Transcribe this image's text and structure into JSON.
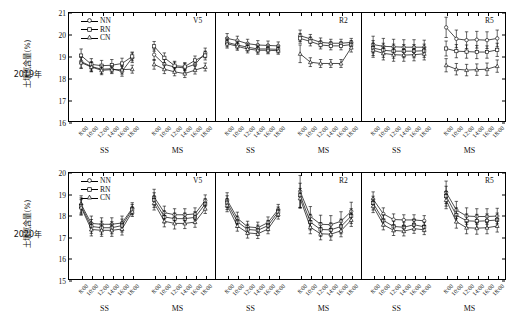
{
  "figure": {
    "y_axis_title": "土壤氮含量(%)",
    "group_labels": [
      "SS",
      "MS"
    ],
    "time_ticks": [
      "8:00",
      "10:00",
      "12:00",
      "14:00",
      "16:00",
      "18:00"
    ],
    "series_names": [
      "NN",
      "RN",
      "CN"
    ],
    "series_markers": [
      "open-circle",
      "open-square",
      "open-triangle"
    ],
    "line_color": "#000000",
    "marker_fill": "#ffffff",
    "background": "#ffffff"
  },
  "rows": [
    {
      "year_label": "2019年",
      "ylim": [
        16,
        21
      ],
      "yticks": [
        "16",
        "17",
        "18",
        "19",
        "20",
        "21"
      ],
      "has_legend": true,
      "panels": [
        {
          "stage": "V5",
          "groups": [
            {
              "name": "SS",
              "series": [
                {
                  "name": "NN",
                  "values": [
                    18.75,
                    18.52,
                    18.4,
                    18.42,
                    18.3,
                    18.92
                  ],
                  "err": [
                    0.3,
                    0.22,
                    0.2,
                    0.18,
                    0.22,
                    0.22
                  ]
                },
                {
                  "name": "RN",
                  "values": [
                    19.02,
                    18.62,
                    18.56,
                    18.58,
                    18.66,
                    18.98
                  ],
                  "err": [
                    0.3,
                    0.26,
                    0.24,
                    0.26,
                    0.24,
                    0.2
                  ]
                },
                {
                  "name": "CN",
                  "values": [
                    18.7,
                    18.5,
                    18.35,
                    18.38,
                    18.38,
                    18.4
                  ],
                  "err": [
                    0.26,
                    0.22,
                    0.2,
                    0.18,
                    0.2,
                    0.18
                  ]
                }
              ]
            },
            {
              "name": "MS",
              "series": [
                {
                  "name": "NN",
                  "values": [
                    19.06,
                    18.62,
                    18.5,
                    18.46,
                    18.62,
                    19.14
                  ],
                  "err": [
                    0.26,
                    0.22,
                    0.22,
                    0.2,
                    0.22,
                    0.22
                  ]
                },
                {
                  "name": "RN",
                  "values": [
                    19.44,
                    18.92,
                    18.56,
                    18.52,
                    18.8,
                    19.02
                  ],
                  "err": [
                    0.22,
                    0.22,
                    0.2,
                    0.18,
                    0.2,
                    0.2
                  ]
                },
                {
                  "name": "CN",
                  "values": [
                    18.62,
                    18.4,
                    18.28,
                    18.2,
                    18.36,
                    18.5
                  ],
                  "err": [
                    0.22,
                    0.2,
                    0.18,
                    0.18,
                    0.18,
                    0.18
                  ]
                }
              ]
            }
          ]
        },
        {
          "stage": "R2",
          "groups": [
            {
              "name": "SS",
              "series": [
                {
                  "name": "NN",
                  "values": [
                    19.8,
                    19.7,
                    19.56,
                    19.5,
                    19.48,
                    19.46
                  ],
                  "err": [
                    0.22,
                    0.2,
                    0.2,
                    0.2,
                    0.2,
                    0.18
                  ]
                },
                {
                  "name": "RN",
                  "values": [
                    19.62,
                    19.5,
                    19.4,
                    19.32,
                    19.32,
                    19.3
                  ],
                  "err": [
                    0.2,
                    0.18,
                    0.18,
                    0.18,
                    0.18,
                    0.16
                  ]
                },
                {
                  "name": "CN",
                  "values": [
                    19.56,
                    19.44,
                    19.32,
                    19.26,
                    19.26,
                    19.24
                  ],
                  "err": [
                    0.2,
                    0.18,
                    0.18,
                    0.18,
                    0.16,
                    0.16
                  ]
                }
              ]
            },
            {
              "name": "MS",
              "series": [
                {
                  "name": "NN",
                  "values": [
                    19.92,
                    19.78,
                    19.62,
                    19.58,
                    19.58,
                    19.62
                  ],
                  "err": [
                    0.26,
                    0.2,
                    0.2,
                    0.18,
                    0.18,
                    0.18
                  ]
                },
                {
                  "name": "RN",
                  "values": [
                    19.8,
                    19.66,
                    19.5,
                    19.46,
                    19.46,
                    19.52
                  ],
                  "err": [
                    0.22,
                    0.2,
                    0.18,
                    0.18,
                    0.18,
                    0.18
                  ]
                },
                {
                  "name": "CN",
                  "values": [
                    19.1,
                    18.72,
                    18.66,
                    18.66,
                    18.66,
                    19.38
                  ],
                  "err": [
                    0.4,
                    0.2,
                    0.18,
                    0.18,
                    0.18,
                    0.2
                  ]
                }
              ]
            }
          ]
        },
        {
          "stage": "R5",
          "groups": [
            {
              "name": "SS",
              "series": [
                {
                  "name": "NN",
                  "values": [
                    19.52,
                    19.44,
                    19.42,
                    19.4,
                    19.4,
                    19.4
                  ],
                  "err": [
                    0.38,
                    0.36,
                    0.34,
                    0.34,
                    0.34,
                    0.32
                  ]
                },
                {
                  "name": "RN",
                  "values": [
                    19.36,
                    19.26,
                    19.22,
                    19.22,
                    19.22,
                    19.24
                  ],
                  "err": [
                    0.34,
                    0.32,
                    0.32,
                    0.3,
                    0.3,
                    0.3
                  ]
                },
                {
                  "name": "CN",
                  "values": [
                    19.26,
                    19.12,
                    19.06,
                    19.04,
                    19.06,
                    19.1
                  ],
                  "err": [
                    0.32,
                    0.3,
                    0.3,
                    0.28,
                    0.28,
                    0.28
                  ]
                }
              ]
            },
            {
              "name": "MS",
              "series": [
                {
                  "name": "NN",
                  "values": [
                    20.3,
                    19.78,
                    19.72,
                    19.74,
                    19.72,
                    19.8
                  ],
                  "err": [
                    0.46,
                    0.4,
                    0.38,
                    0.38,
                    0.38,
                    0.38
                  ]
                },
                {
                  "name": "RN",
                  "values": [
                    19.34,
                    19.22,
                    19.2,
                    19.18,
                    19.18,
                    19.28
                  ],
                  "err": [
                    0.34,
                    0.3,
                    0.3,
                    0.3,
                    0.28,
                    0.3
                  ]
                },
                {
                  "name": "CN",
                  "values": [
                    18.58,
                    18.4,
                    18.36,
                    18.38,
                    18.4,
                    18.54
                  ],
                  "err": [
                    0.3,
                    0.26,
                    0.26,
                    0.26,
                    0.28,
                    0.28
                  ]
                }
              ]
            }
          ]
        }
      ]
    },
    {
      "year_label": "2020年",
      "ylim": [
        15,
        20
      ],
      "yticks": [
        "15",
        "16",
        "17",
        "18",
        "19",
        "20"
      ],
      "has_legend": true,
      "panels": [
        {
          "stage": "V5",
          "groups": [
            {
              "name": "SS",
              "series": [
                {
                  "name": "NN",
                  "values": [
                    18.5,
                    17.62,
                    17.58,
                    17.58,
                    17.64,
                    18.32
                  ],
                  "err": [
                    0.4,
                    0.34,
                    0.3,
                    0.3,
                    0.32,
                    0.26
                  ]
                },
                {
                  "name": "RN",
                  "values": [
                    18.42,
                    17.48,
                    17.42,
                    17.42,
                    17.52,
                    18.26
                  ],
                  "err": [
                    0.38,
                    0.32,
                    0.3,
                    0.28,
                    0.3,
                    0.24
                  ]
                },
                {
                  "name": "CN",
                  "values": [
                    18.36,
                    17.34,
                    17.3,
                    17.3,
                    17.36,
                    18.16
                  ],
                  "err": [
                    0.36,
                    0.3,
                    0.28,
                    0.28,
                    0.28,
                    0.22
                  ]
                }
              ]
            },
            {
              "name": "MS",
              "series": [
                {
                  "name": "NN",
                  "values": [
                    18.84,
                    18.12,
                    18.02,
                    18.02,
                    18.06,
                    18.68
                  ],
                  "err": [
                    0.36,
                    0.3,
                    0.28,
                    0.28,
                    0.28,
                    0.26
                  ]
                },
                {
                  "name": "RN",
                  "values": [
                    18.7,
                    17.92,
                    17.84,
                    17.84,
                    17.9,
                    18.52
                  ],
                  "err": [
                    0.34,
                    0.28,
                    0.26,
                    0.26,
                    0.26,
                    0.24
                  ]
                },
                {
                  "name": "CN",
                  "values": [
                    18.56,
                    17.72,
                    17.62,
                    17.62,
                    17.68,
                    18.3
                  ],
                  "err": [
                    0.32,
                    0.26,
                    0.26,
                    0.24,
                    0.24,
                    0.22
                  ]
                }
              ]
            }
          ]
        },
        {
          "stage": "R2",
          "groups": [
            {
              "name": "SS",
              "series": [
                {
                  "name": "NN",
                  "values": [
                    18.7,
                    17.86,
                    17.46,
                    17.42,
                    17.66,
                    18.26
                  ],
                  "err": [
                    0.34,
                    0.28,
                    0.26,
                    0.26,
                    0.26,
                    0.24
                  ]
                },
                {
                  "name": "RN",
                  "values": [
                    18.58,
                    17.7,
                    17.34,
                    17.3,
                    17.52,
                    18.16
                  ],
                  "err": [
                    0.32,
                    0.26,
                    0.24,
                    0.24,
                    0.24,
                    0.22
                  ]
                },
                {
                  "name": "CN",
                  "values": [
                    18.46,
                    17.5,
                    17.18,
                    17.14,
                    17.36,
                    18.04
                  ],
                  "err": [
                    0.3,
                    0.24,
                    0.24,
                    0.22,
                    0.22,
                    0.22
                  ]
                }
              ]
            },
            {
              "name": "MS",
              "series": [
                {
                  "name": "NN",
                  "values": [
                    19.1,
                    17.94,
                    17.58,
                    17.56,
                    17.72,
                    18.18
                  ],
                  "err": [
                    0.74,
                    0.46,
                    0.42,
                    0.42,
                    0.44,
                    0.42
                  ]
                },
                {
                  "name": "RN",
                  "values": [
                    18.92,
                    17.68,
                    17.34,
                    17.32,
                    17.48,
                    17.96
                  ],
                  "err": [
                    0.56,
                    0.36,
                    0.32,
                    0.32,
                    0.34,
                    0.34
                  ]
                },
                {
                  "name": "CN",
                  "values": [
                    18.78,
                    17.44,
                    17.14,
                    17.12,
                    17.28,
                    17.78
                  ],
                  "err": [
                    0.46,
                    0.3,
                    0.28,
                    0.28,
                    0.28,
                    0.3
                  ]
                }
              ]
            }
          ]
        },
        {
          "stage": "R5",
          "groups": [
            {
              "name": "SS",
              "series": [
                {
                  "name": "NN",
                  "values": [
                    18.74,
                    18.06,
                    17.8,
                    17.78,
                    17.78,
                    17.74
                  ],
                  "err": [
                    0.34,
                    0.28,
                    0.26,
                    0.24,
                    0.24,
                    0.24
                  ]
                },
                {
                  "name": "RN",
                  "values": [
                    18.56,
                    17.76,
                    17.48,
                    17.44,
                    17.56,
                    17.46
                  ],
                  "err": [
                    0.32,
                    0.26,
                    0.24,
                    0.24,
                    0.24,
                    0.22
                  ]
                },
                {
                  "name": "CN",
                  "values": [
                    18.42,
                    17.56,
                    17.3,
                    17.26,
                    17.38,
                    17.32
                  ],
                  "err": [
                    0.3,
                    0.24,
                    0.24,
                    0.22,
                    0.22,
                    0.22
                  ]
                }
              ]
            },
            {
              "name": "MS",
              "series": [
                {
                  "name": "NN",
                  "values": [
                    19.06,
                    18.24,
                    17.96,
                    17.94,
                    17.94,
                    17.96
                  ],
                  "err": [
                    0.52,
                    0.4,
                    0.38,
                    0.36,
                    0.36,
                    0.36
                  ]
                },
                {
                  "name": "RN",
                  "values": [
                    18.88,
                    18.0,
                    17.74,
                    17.72,
                    17.74,
                    17.78
                  ],
                  "err": [
                    0.46,
                    0.34,
                    0.32,
                    0.32,
                    0.32,
                    0.32
                  ]
                },
                {
                  "name": "CN",
                  "values": [
                    18.7,
                    17.7,
                    17.42,
                    17.4,
                    17.42,
                    17.5
                  ],
                  "err": [
                    0.4,
                    0.3,
                    0.28,
                    0.28,
                    0.28,
                    0.28
                  ]
                }
              ]
            }
          ]
        }
      ]
    }
  ]
}
